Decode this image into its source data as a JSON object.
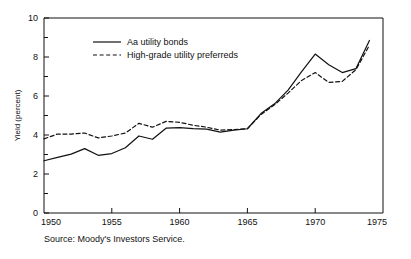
{
  "figure": {
    "source_note": "Source: Moody's Investors Service.",
    "ylabel": "Yield (percent)"
  },
  "chart_data": {
    "type": "line",
    "title": "",
    "xlabel": "",
    "ylabel": "Yield (percent)",
    "xlim": [
      1950,
      1975
    ],
    "ylim": [
      0,
      10
    ],
    "xticks": [
      1950,
      1955,
      1960,
      1965,
      1970,
      1975
    ],
    "xtick_labels": [
      "1950",
      "1955",
      "1960",
      "1965",
      "1970",
      "1975"
    ],
    "yticks": [
      0,
      2,
      4,
      6,
      8,
      10
    ],
    "ytick_labels": [
      "0",
      "2",
      "4",
      "6",
      "8",
      "10"
    ],
    "y_minor_ticks": [
      1,
      3,
      5,
      7,
      9
    ],
    "grid": false,
    "legend_position": "upper-left-inside",
    "x": [
      1950,
      1951,
      1952,
      1953,
      1954,
      1955,
      1956,
      1957,
      1958,
      1959,
      1960,
      1961,
      1962,
      1963,
      1964,
      1965,
      1966,
      1967,
      1968,
      1969,
      1970,
      1971,
      1972,
      1973,
      1974
    ],
    "series": [
      {
        "name": "Aa utility bonds",
        "style": "solid",
        "color": "#111111",
        "values": [
          2.68,
          2.85,
          3.02,
          3.3,
          2.96,
          3.05,
          3.35,
          3.95,
          3.78,
          4.35,
          4.38,
          4.33,
          4.3,
          4.15,
          4.25,
          4.32,
          5.1,
          5.6,
          6.3,
          7.25,
          8.15,
          7.6,
          7.2,
          7.4,
          8.85
        ]
      },
      {
        "name": "High-grade utility preferreds",
        "style": "dashed",
        "color": "#111111",
        "values": [
          3.8,
          4.05,
          4.05,
          4.1,
          3.85,
          3.95,
          4.1,
          4.6,
          4.4,
          4.7,
          4.65,
          4.5,
          4.4,
          4.25,
          4.28,
          4.32,
          5.05,
          5.55,
          6.15,
          6.8,
          7.2,
          6.7,
          6.75,
          7.35,
          8.6
        ]
      }
    ],
    "legend": [
      {
        "label": "Aa utility bonds",
        "style": "solid"
      },
      {
        "label": "High-grade utility preferreds",
        "style": "dashed"
      }
    ]
  }
}
